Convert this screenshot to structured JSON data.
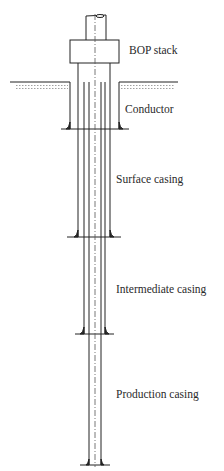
{
  "diagram": {
    "type": "well casing schematic",
    "labels": {
      "bop": "BOP stack",
      "conductor": "Conductor",
      "surface": "Surface casing",
      "intermediate": "Intermediate casing",
      "production": "Production casing"
    },
    "colors": {
      "line": "#222222",
      "water": "#888888"
    }
  }
}
